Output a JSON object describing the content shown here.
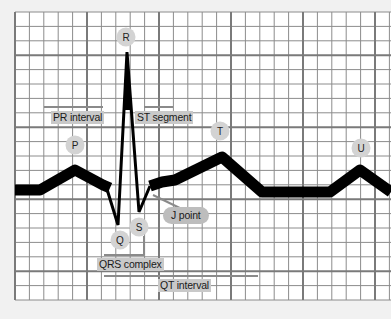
{
  "diagram": {
    "colors": {
      "background": "#f1f1f1",
      "grid_bg": "#ffffff",
      "grid_minor": "#8a8a8a",
      "grid_major": "#777777",
      "trace": "#000000",
      "label_bg": "#c9c9c9",
      "point_bg": "#d3d3d3"
    },
    "waves": [
      {
        "id": "P",
        "label": "P"
      },
      {
        "id": "Q",
        "label": "Q"
      },
      {
        "id": "R",
        "label": "R"
      },
      {
        "id": "S",
        "label": "S"
      },
      {
        "id": "T",
        "label": "T"
      },
      {
        "id": "U",
        "label": "U"
      }
    ],
    "intervals": [
      {
        "id": "pr",
        "label": "PR interval"
      },
      {
        "id": "st",
        "label": "ST segment"
      },
      {
        "id": "j",
        "label": "J point"
      },
      {
        "id": "qrs",
        "label": "QRS complex"
      },
      {
        "id": "qt",
        "label": "QT interval"
      }
    ]
  }
}
